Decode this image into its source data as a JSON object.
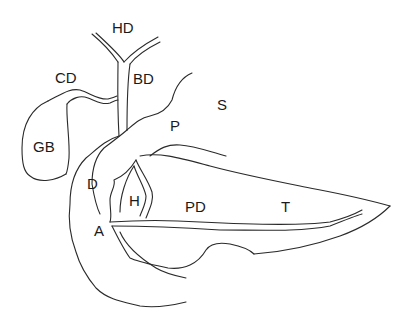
{
  "diagram": {
    "type": "anatomical line drawing",
    "labels": [
      {
        "id": "HD",
        "text": "HD",
        "x": 112,
        "y": 33
      },
      {
        "id": "CD",
        "text": "CD",
        "x": 55,
        "y": 83
      },
      {
        "id": "BD",
        "text": "BD",
        "x": 133,
        "y": 84
      },
      {
        "id": "S",
        "text": "S",
        "x": 217,
        "y": 110
      },
      {
        "id": "P",
        "text": "P",
        "x": 170,
        "y": 131
      },
      {
        "id": "GB",
        "text": "GB",
        "x": 33,
        "y": 152
      },
      {
        "id": "D",
        "text": "D",
        "x": 87,
        "y": 189
      },
      {
        "id": "H",
        "text": "H",
        "x": 129,
        "y": 206
      },
      {
        "id": "PD",
        "text": "PD",
        "x": 185,
        "y": 212
      },
      {
        "id": "T",
        "text": "T",
        "x": 281,
        "y": 212
      },
      {
        "id": "A",
        "text": "A",
        "x": 94,
        "y": 236
      }
    ]
  }
}
